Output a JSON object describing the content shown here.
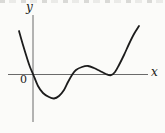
{
  "figure": {
    "background": "#fbfbf9",
    "curve_color": "#1c1c1c",
    "axis_color": "#6a6a6a",
    "text_color": "#1a1a1a"
  },
  "labels": {
    "x_axis": "x",
    "y_axis": "y",
    "origin": "0"
  },
  "chart_data": {
    "type": "line",
    "title": "",
    "xlabel": "x",
    "ylabel": "y",
    "origin_label": "0",
    "grid": false,
    "legend": false,
    "axes_px": {
      "x_axis": {
        "x1": 8,
        "y1": 74.5,
        "x2": 148,
        "y2": 74.5
      },
      "y_axis": {
        "x1": 33,
        "y1": 15,
        "x2": 33,
        "y2": 122
      }
    },
    "curve_points_px": [
      [
        19,
        31
      ],
      [
        23,
        45
      ],
      [
        27,
        58
      ],
      [
        30,
        67
      ],
      [
        33,
        74
      ],
      [
        38,
        86
      ],
      [
        43,
        93
      ],
      [
        49,
        97
      ],
      [
        54,
        98.5
      ],
      [
        59,
        96
      ],
      [
        64,
        90
      ],
      [
        68,
        82
      ],
      [
        72,
        75
      ],
      [
        76,
        70
      ],
      [
        82,
        67
      ],
      [
        88,
        66
      ],
      [
        94,
        68
      ],
      [
        100,
        71
      ],
      [
        106,
        74
      ],
      [
        111,
        75.2
      ],
      [
        115,
        72
      ],
      [
        119,
        65
      ],
      [
        124,
        55
      ],
      [
        129,
        44
      ],
      [
        134,
        34
      ],
      [
        139,
        26
      ]
    ],
    "features": {
      "x_intercepts_px": [
        33,
        70,
        111
      ],
      "local_minimum_px": [
        54,
        98.5
      ],
      "local_maximum_px": [
        88,
        66
      ],
      "tangent_touch_point_px": [
        111,
        75.2
      ]
    }
  }
}
